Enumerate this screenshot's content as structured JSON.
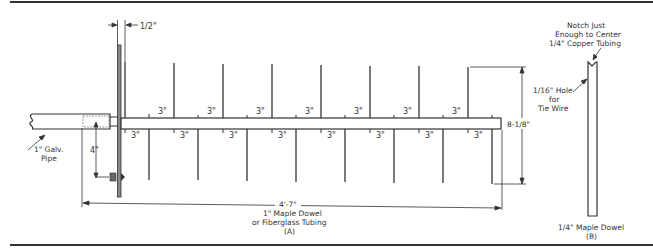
{
  "figure": {
    "labels": {
      "half_inch": "1/2\"",
      "galv_pipe_line1": "1\" Galv.",
      "galv_pipe_line2": "Pipe",
      "four_inch": "4\"",
      "overall_length": "4'-7\"",
      "boom_line1": "1\" Maple Dowel",
      "boom_line2": "or Fiberglass Tubing",
      "boom_line3": "(A)",
      "element_height": "8-1/8\"",
      "hole_line1": "1/16\" Hole",
      "hole_line2": "for",
      "hole_line3": "Tie Wire",
      "notch_line1": "Notch Just",
      "notch_line2": "Enough to Center",
      "notch_line3": "1/4\" Copper Tubing",
      "dowel_b_line1": "1/4\" Maple Dowel",
      "dowel_b_line2": "(B)"
    },
    "spacing_labels": {
      "upper": [
        "3\"",
        "3\"",
        "3\"",
        "3\"",
        "3\"",
        "3\"",
        "3\""
      ],
      "lower": [
        "3\"",
        "3\"",
        "3\"",
        "3\"",
        "3\"",
        "3\"",
        "3\"",
        "3\""
      ]
    },
    "colors": {
      "line": "#333333",
      "background": "#ffffff"
    }
  }
}
